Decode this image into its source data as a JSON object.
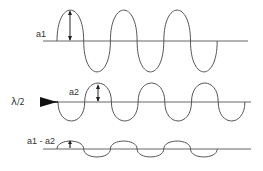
{
  "diagram": {
    "colors": {
      "line": "#555555",
      "text": "#333333",
      "background": "#ffffff"
    },
    "waves": [
      {
        "id": "wave1",
        "label": "a1",
        "baseline_y": 41,
        "x_start": 57,
        "half_period": 26.7,
        "amplitude": 31,
        "first_direction": "up",
        "half_cycles": 6,
        "axis_x": [
          43,
          248
        ]
      },
      {
        "id": "wave2",
        "label": "a2",
        "baseline_y": 102,
        "x_start": 58,
        "half_period": 26.7,
        "amplitude": 19,
        "first_direction": "down",
        "half_cycles": 7,
        "axis_x": [
          57,
          251
        ]
      },
      {
        "id": "wave3",
        "label": "a1 - a2",
        "baseline_y": 149,
        "x_start": 57,
        "half_period": 26.7,
        "amplitude": 8,
        "first_direction": "up",
        "half_cycles": 6,
        "axis_x": [
          43,
          251
        ]
      }
    ],
    "shift_marker": {
      "label_main": "λ",
      "label_sub": "/2",
      "icon": "triangle-arrow-right"
    }
  }
}
